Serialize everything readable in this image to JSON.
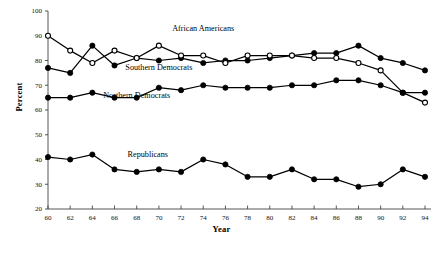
{
  "chart_data": {
    "type": "line",
    "title": "",
    "xlabel": "Year",
    "ylabel": "Percent",
    "xlim": [
      60,
      94
    ],
    "ylim": [
      20,
      100
    ],
    "ytick_step": 10,
    "xtick_step": 2,
    "grid": false,
    "legend_position": "inline-annotations",
    "x": [
      60,
      62,
      64,
      66,
      68,
      70,
      72,
      74,
      76,
      78,
      80,
      82,
      84,
      86,
      88,
      90,
      92,
      94
    ],
    "xticklabels": [
      "60",
      "62",
      "64",
      "66",
      "68",
      "70",
      "72",
      "74",
      "76",
      "78",
      "80",
      "82",
      "84",
      "86",
      "88",
      "90",
      "92",
      "94"
    ],
    "yticklabels": [
      "20",
      "30",
      "40",
      "50",
      "60",
      "70",
      "80",
      "90",
      "100"
    ],
    "series": [
      {
        "name": "African Americans",
        "marker": "filled-circle",
        "label_x": 74,
        "label_y": 92,
        "values": [
          77,
          75,
          86,
          78,
          81,
          80,
          81,
          79,
          80,
          80,
          81,
          82,
          83,
          83,
          86,
          81,
          79,
          76
        ]
      },
      {
        "name": "Southern Democrats",
        "marker": "open-circle",
        "label_x": 70,
        "label_y": 76,
        "values": [
          90,
          84,
          79,
          84,
          81,
          86,
          82,
          82,
          79,
          82,
          82,
          82,
          81,
          81,
          79,
          76,
          67,
          63
        ]
      },
      {
        "name": "Northern Democrats",
        "marker": "filled-circle",
        "label_x": 68,
        "label_y": 65,
        "values": [
          65,
          65,
          67,
          65,
          65,
          69,
          68,
          70,
          69,
          69,
          69,
          70,
          70,
          72,
          72,
          70,
          67,
          67
        ]
      },
      {
        "name": "Republicans",
        "marker": "filled-circle",
        "label_x": 69,
        "label_y": 41,
        "values": [
          41,
          40,
          42,
          36,
          35,
          36,
          35,
          40,
          38,
          33,
          33,
          36,
          32,
          32,
          29,
          30,
          36,
          33
        ]
      }
    ]
  },
  "axes": {
    "x_axis_title": "Year",
    "y_axis_title": "Percent"
  }
}
